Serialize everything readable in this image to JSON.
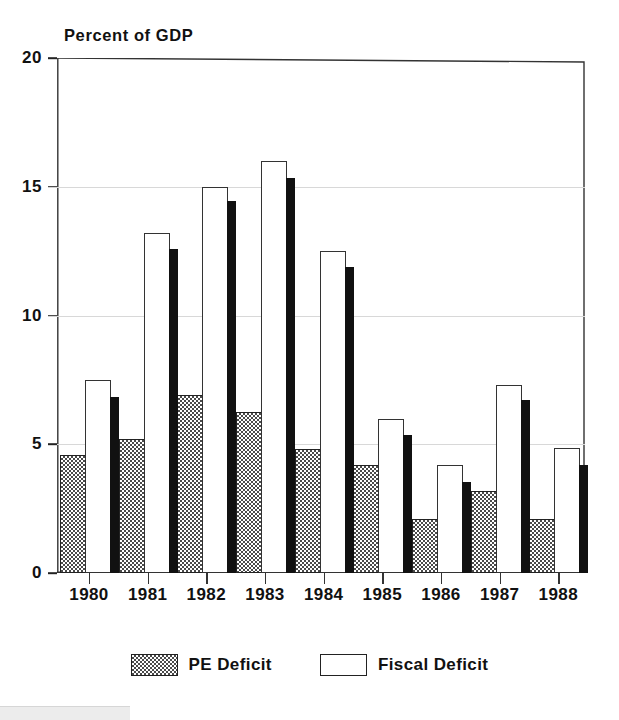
{
  "chart_data": {
    "type": "bar",
    "title": "Percent of GDP",
    "xlabel": "",
    "ylabel": "Percent of GDP",
    "ylim": [
      0,
      20
    ],
    "yticks": [
      0,
      5,
      10,
      15,
      20
    ],
    "grid": true,
    "legend_position": "bottom-center",
    "categories": [
      "1980",
      "1981",
      "1982",
      "1983",
      "1984",
      "1985",
      "1986",
      "1987",
      "1988"
    ],
    "series": [
      {
        "name": "PE Deficit",
        "style": "hatched",
        "values": [
          4.6,
          5.2,
          6.9,
          6.25,
          4.8,
          4.2,
          2.1,
          3.2,
          2.1
        ]
      },
      {
        "name": "Fiscal Deficit",
        "style": "white-outline",
        "values": [
          7.5,
          13.2,
          15.0,
          16.0,
          12.5,
          6.0,
          4.2,
          7.3,
          4.85
        ]
      },
      {
        "name": "",
        "style": "solid-black",
        "values": [
          6.85,
          12.6,
          14.45,
          15.35,
          11.9,
          5.35,
          3.55,
          6.7,
          4.2
        ]
      }
    ]
  },
  "axes": {
    "y_tick_labels": [
      "0",
      "5",
      "10",
      "15",
      "20"
    ],
    "x_tick_labels": [
      "1980",
      "1981",
      "1982",
      "1983",
      "1984",
      "1985",
      "1986",
      "1987",
      "1988"
    ]
  },
  "legend": {
    "items": [
      {
        "label": "PE Deficit",
        "swatch": "hatched-swatch"
      },
      {
        "label": "Fiscal Deficit",
        "swatch": "white-swatch"
      }
    ]
  },
  "colors": {
    "bar_black": "#111111",
    "bar_white": "#ffffff",
    "bar_hatch": "#4a4a4a",
    "axis": "#222222",
    "grid": "#d8d8d8"
  }
}
